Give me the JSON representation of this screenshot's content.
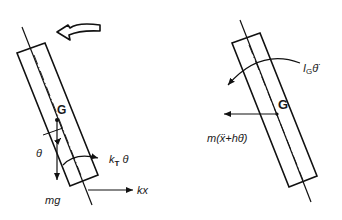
{
  "diagram": {
    "left_panel": {
      "rotation_arrow": "counter-clockwise-arrow",
      "labels": {
        "center_of_gravity": "G",
        "angle": "θ",
        "torsional_spring_moment": "k",
        "torsional_spring_subscript": "T",
        "torsional_spring_var": " θ",
        "weight": "mg",
        "spring_force": "kx"
      }
    },
    "right_panel": {
      "labels": {
        "center_of_gravity": "G",
        "inertia_moment_I": "I",
        "inertia_moment_sub": "G",
        "inertia_moment_var": "θ̈",
        "inertia_force": "m(ẍ+hθ̈)"
      }
    },
    "colors": {
      "stroke": "#111111",
      "background": "#ffffff"
    }
  }
}
